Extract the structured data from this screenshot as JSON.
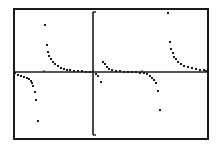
{
  "screen": {
    "type": "graphing-calculator-graph",
    "background": "#ffffff",
    "ink": "#1a1a1a",
    "frame": {
      "x": 14,
      "y": 9,
      "w": 194,
      "h": 130
    },
    "x_axis_y": 72,
    "y_axis": {
      "x": 93,
      "top": 12,
      "bottom": 135,
      "tick_len": 3
    },
    "x_ticks": [
      44,
      93,
      142
    ],
    "mode": "dot"
  },
  "chart_data": {
    "type": "scatter",
    "title": "",
    "xlabel": "",
    "ylabel": "",
    "grid": false,
    "legend": "none",
    "series": [
      {
        "name": "branch-left-lower",
        "points": [
          [
            15,
            73
          ],
          [
            18,
            75
          ],
          [
            21,
            76
          ],
          [
            24,
            77
          ],
          [
            27,
            78
          ],
          [
            29,
            79
          ],
          [
            31,
            81
          ],
          [
            32,
            83
          ],
          [
            33,
            86
          ],
          [
            35,
            92
          ],
          [
            36,
            100
          ],
          [
            38,
            121
          ]
        ]
      },
      {
        "name": "branch-1-upper",
        "points": [
          [
            45,
            25
          ],
          [
            47,
            45
          ],
          [
            48,
            52
          ],
          [
            49,
            56
          ],
          [
            51,
            59
          ],
          [
            53,
            62
          ],
          [
            55,
            64
          ],
          [
            58,
            66
          ],
          [
            61,
            68
          ],
          [
            64,
            69
          ],
          [
            67,
            70
          ],
          [
            70,
            70
          ],
          [
            74,
            71
          ],
          [
            78,
            71
          ],
          [
            82,
            71
          ],
          [
            86,
            72
          ],
          [
            90,
            72
          ]
        ]
      },
      {
        "name": "near-origin",
        "points": [
          [
            96,
            74
          ],
          [
            98,
            76
          ],
          [
            101,
            82
          ],
          [
            103,
            62
          ],
          [
            105,
            64
          ],
          [
            107,
            67
          ],
          [
            109,
            69
          ]
        ]
      },
      {
        "name": "branch-2",
        "points": [
          [
            112,
            70
          ],
          [
            116,
            71
          ],
          [
            120,
            71
          ],
          [
            124,
            72
          ],
          [
            128,
            72
          ],
          [
            132,
            72
          ],
          [
            136,
            72
          ],
          [
            140,
            73
          ],
          [
            144,
            73
          ],
          [
            147,
            74
          ],
          [
            150,
            76
          ],
          [
            152,
            78
          ],
          [
            154,
            80
          ],
          [
            156,
            83
          ],
          [
            158,
            91
          ],
          [
            160,
            110
          ]
        ]
      },
      {
        "name": "branch-3-upper",
        "points": [
          [
            168,
            13
          ],
          [
            170,
            42
          ],
          [
            171,
            49
          ],
          [
            173,
            53
          ],
          [
            174,
            57
          ],
          [
            176,
            59
          ],
          [
            178,
            62
          ],
          [
            181,
            64
          ],
          [
            184,
            66
          ],
          [
            188,
            67
          ],
          [
            192,
            68
          ],
          [
            196,
            69
          ],
          [
            200,
            70
          ],
          [
            204,
            70
          ],
          [
            206,
            71
          ]
        ]
      }
    ]
  }
}
